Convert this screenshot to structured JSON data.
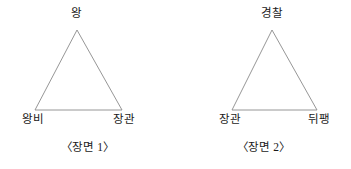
{
  "figure": {
    "background_color": "#ffffff",
    "line_color": "#8a8a8a",
    "text_color": "#1a1a1a",
    "scenes": [
      {
        "caption": "〈장면 1〉",
        "apex_label": "왕",
        "bottom_left_label": "왕비",
        "bottom_right_label": "장관",
        "geometry": {
          "apex_x": 77,
          "apex_y": 30,
          "base_left_x": 35,
          "base_right_x": 122,
          "base_y": 110
        }
      },
      {
        "caption": "〈장면 2〉",
        "apex_label": "경찰",
        "bottom_left_label": "장관",
        "bottom_right_label": "뒤팽",
        "geometry": {
          "apex_x": 96,
          "apex_y": 30,
          "base_left_x": 56,
          "base_right_x": 141,
          "base_y": 110
        }
      }
    ]
  }
}
